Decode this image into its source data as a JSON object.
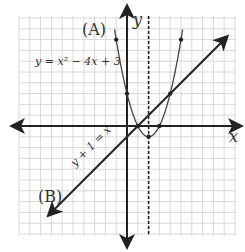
{
  "chart_data": {
    "type": "line",
    "title": "",
    "xlabel": "x",
    "ylabel": "y",
    "xlim": [
      -10,
      10
    ],
    "ylim": [
      -10,
      10
    ],
    "grid": true,
    "series": [
      {
        "name": "(A)",
        "equation": "y = x² − 4x + 3",
        "kind": "parabola",
        "points": [
          [
            -1,
            8
          ],
          [
            0,
            3
          ],
          [
            1,
            0
          ],
          [
            2,
            -1
          ],
          [
            3,
            0
          ],
          [
            4,
            3
          ],
          [
            5,
            8
          ]
        ]
      },
      {
        "name": "(B)",
        "equation": "y + 1 = x",
        "kind": "line",
        "points": [
          [
            -7,
            -8
          ],
          [
            0,
            -1
          ],
          [
            1,
            0
          ],
          [
            4,
            3
          ],
          [
            9,
            8
          ]
        ]
      },
      {
        "name": "axis of symmetry",
        "equation": "x = 2",
        "kind": "dashed-vertical"
      }
    ],
    "annotations": [
      "(A)",
      "(B)",
      "y = x² − 4x + 3",
      "y + 1 = x"
    ]
  },
  "labels": {
    "a": "(A)",
    "b": "(B)",
    "eq_a": "y = x² − 4x + 3",
    "eq_b": "y + 1 = x",
    "x_axis": "x",
    "y_axis": "y"
  }
}
